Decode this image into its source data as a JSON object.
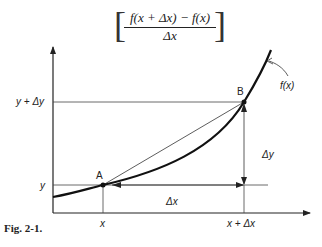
{
  "formula": {
    "numerator": "f(x + Δx) − f(x)",
    "denominator": "Δx",
    "left_bracket": "[",
    "right_bracket": "]"
  },
  "diagram": {
    "curve_label": "f(x)",
    "point_a_label": "A",
    "point_b_label": "B",
    "y_tick_upper": "y + Δy",
    "y_tick_lower": "y",
    "x_tick_left": "x",
    "x_tick_right": "x + Δx",
    "delta_x_label": "Δx",
    "delta_y_label": "Δy"
  },
  "caption": "Fig. 2-1."
}
